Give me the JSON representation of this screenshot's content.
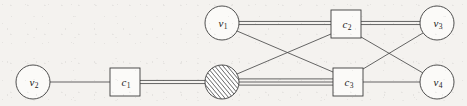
{
  "figure": {
    "background_color": "#f4f2ef",
    "stroke_color": "#3c3c3c",
    "node_fill": "#fbfaf8",
    "width": 467,
    "height": 106
  },
  "variable_nodes": [
    {
      "id": "v1",
      "label": "v",
      "subscript": "1",
      "shape": "circle",
      "cx": 222,
      "cy": 23,
      "r": 17
    },
    {
      "id": "v2",
      "label": "v",
      "subscript": "2",
      "shape": "circle",
      "cx": 33,
      "cy": 82,
      "r": 17
    },
    {
      "id": "v3",
      "label": "v",
      "subscript": "3",
      "shape": "circle",
      "cx": 437,
      "cy": 23,
      "r": 17
    },
    {
      "id": "v4",
      "label": "v",
      "subscript": "4",
      "shape": "circle",
      "cx": 437,
      "cy": 82,
      "r": 17
    }
  ],
  "hatched_node": {
    "id": "hatched",
    "label": "",
    "subscript": "",
    "shape": "hatched-circle",
    "cx": 222,
    "cy": 82,
    "r": 17,
    "hatch_direction": "diagonal-up-right"
  },
  "factor_nodes": [
    {
      "id": "c1",
      "label": "c",
      "subscript": "1",
      "shape": "square",
      "x": 110,
      "y": 68,
      "w": 30,
      "h": 28
    },
    {
      "id": "c2",
      "label": "c",
      "subscript": "2",
      "shape": "square",
      "x": 331,
      "y": 10,
      "w": 30,
      "h": 28
    },
    {
      "id": "c3",
      "label": "c",
      "subscript": "3",
      "shape": "square",
      "x": 333,
      "y": 68,
      "w": 30,
      "h": 28
    }
  ],
  "edges": [
    {
      "id": "e-v2-c1",
      "from": "v2",
      "to": "c1",
      "multiplicity": 1,
      "x1": 50,
      "y1": 82,
      "x2": 110,
      "y2": 82
    },
    {
      "id": "e-c1-hatched",
      "from": "c1",
      "to": "hatched",
      "multiplicity": 2,
      "x1": 140,
      "y1": 82,
      "x2": 205,
      "y2": 82
    },
    {
      "id": "e-hatched-c3",
      "from": "hatched",
      "to": "c3",
      "multiplicity": 3,
      "x1": 239,
      "y1": 82,
      "x2": 333,
      "y2": 82
    },
    {
      "id": "e-hatched-c2",
      "from": "hatched",
      "to": "c2",
      "multiplicity": 1,
      "x1": 237,
      "y1": 74,
      "x2": 331,
      "y2": 34
    },
    {
      "id": "e-v1-c2",
      "from": "v1",
      "to": "c2",
      "multiplicity": 2,
      "x1": 239,
      "y1": 23,
      "x2": 331,
      "y2": 23
    },
    {
      "id": "e-v1-c3",
      "from": "v1",
      "to": "c3",
      "multiplicity": 1,
      "x1": 237,
      "y1": 31,
      "x2": 333,
      "y2": 72
    },
    {
      "id": "e-c2-v3",
      "from": "c2",
      "to": "v3",
      "multiplicity": 2,
      "x1": 361,
      "y1": 23,
      "x2": 420,
      "y2": 23
    },
    {
      "id": "e-c2-v4",
      "from": "c2",
      "to": "v4",
      "multiplicity": 1,
      "x1": 361,
      "y1": 37,
      "x2": 423,
      "y2": 73
    },
    {
      "id": "e-c3-v3",
      "from": "c3",
      "to": "v3",
      "multiplicity": 1,
      "x1": 363,
      "y1": 69,
      "x2": 423,
      "y2": 33
    },
    {
      "id": "e-c3-v4",
      "from": "c3",
      "to": "v4",
      "multiplicity": 1,
      "x1": 363,
      "y1": 82,
      "x2": 420,
      "y2": 82
    }
  ]
}
